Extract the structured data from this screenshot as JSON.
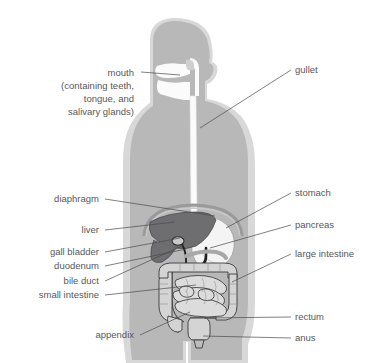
{
  "colors": {
    "background": "#ffffff",
    "body_outer": "#d8d8d8",
    "body_inner": "#b6b6b6",
    "cavity": "#f2f2f2",
    "liver": "#6e6e70",
    "stomach": "#ededed",
    "intestine": "#d0d0d0",
    "text": "#58585a",
    "leader_line": "#4a4a4c",
    "organ_outline": "#3a3a3c"
  },
  "labels_left": [
    {
      "name": "mouth",
      "lines": [
        "mouth",
        "(containing teeth,",
        "tongue, and",
        "salivary glands)"
      ],
      "text_x": 134,
      "text_y": 76,
      "line_height": 13,
      "leader": {
        "x1": 141,
        "y1": 72,
        "x2": 180,
        "y2": 75
      }
    },
    {
      "name": "diaphragm",
      "lines": [
        "diaphragm"
      ],
      "text_x": 99,
      "text_y": 202,
      "line_height": 13,
      "leader": {
        "x1": 105,
        "y1": 199,
        "x2": 215,
        "y2": 216
      }
    },
    {
      "name": "liver",
      "lines": [
        "liver"
      ],
      "text_x": 99,
      "text_y": 233,
      "line_height": 13,
      "leader": {
        "x1": 105,
        "y1": 230,
        "x2": 175,
        "y2": 222
      }
    },
    {
      "name": "gall bladder",
      "lines": [
        "gall bladder"
      ],
      "text_x": 99,
      "text_y": 255,
      "line_height": 13,
      "leader": {
        "x1": 105,
        "y1": 252,
        "x2": 180,
        "y2": 238
      }
    },
    {
      "name": "duodenum",
      "lines": [
        "duodenum"
      ],
      "text_x": 99,
      "text_y": 269,
      "line_height": 13,
      "leader": {
        "x1": 105,
        "y1": 266,
        "x2": 186,
        "y2": 249
      }
    },
    {
      "name": "bile duct",
      "lines": [
        "bile duct"
      ],
      "text_x": 99,
      "text_y": 284,
      "line_height": 13,
      "leader": {
        "x1": 105,
        "y1": 281,
        "x2": 184,
        "y2": 245
      }
    },
    {
      "name": "small intestine",
      "lines": [
        "small intestine"
      ],
      "text_x": 99,
      "text_y": 298,
      "line_height": 13,
      "leader": {
        "x1": 105,
        "y1": 295,
        "x2": 196,
        "y2": 285
      }
    },
    {
      "name": "appendix",
      "lines": [
        "appendix"
      ],
      "text_x": 134,
      "text_y": 338,
      "line_height": 13,
      "leader": {
        "x1": 140,
        "y1": 335,
        "x2": 190,
        "y2": 312
      }
    }
  ],
  "labels_right": [
    {
      "name": "gullet",
      "lines": [
        "gullet"
      ],
      "text_x": 295,
      "text_y": 73,
      "line_height": 13,
      "leader": {
        "x1": 291,
        "y1": 70,
        "x2": 200,
        "y2": 128
      }
    },
    {
      "name": "stomach",
      "lines": [
        "stomach"
      ],
      "text_x": 295,
      "text_y": 196,
      "line_height": 13,
      "leader": {
        "x1": 291,
        "y1": 193,
        "x2": 226,
        "y2": 228
      }
    },
    {
      "name": "pancreas",
      "lines": [
        "pancreas"
      ],
      "text_x": 295,
      "text_y": 228,
      "line_height": 13,
      "leader": {
        "x1": 291,
        "y1": 225,
        "x2": 210,
        "y2": 248
      }
    },
    {
      "name": "large intestine",
      "lines": [
        "large intestine"
      ],
      "text_x": 295,
      "text_y": 257,
      "line_height": 13,
      "leader": {
        "x1": 291,
        "y1": 254,
        "x2": 232,
        "y2": 282
      }
    },
    {
      "name": "rectum",
      "lines": [
        "rectum"
      ],
      "text_x": 295,
      "text_y": 320,
      "line_height": 13,
      "leader": {
        "x1": 291,
        "y1": 317,
        "x2": 205,
        "y2": 318
      }
    },
    {
      "name": "anus",
      "lines": [
        "anus"
      ],
      "text_x": 295,
      "text_y": 341,
      "line_height": 13,
      "leader": {
        "x1": 291,
        "y1": 338,
        "x2": 203,
        "y2": 336
      }
    }
  ]
}
